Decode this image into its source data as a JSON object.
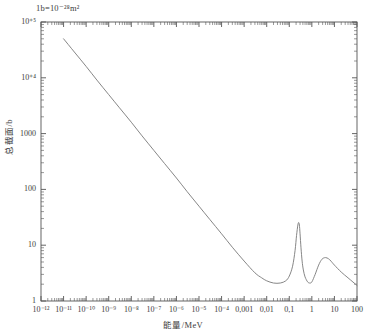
{
  "annotation": {
    "unit_note": "1b=10⁻²⁸m²"
  },
  "axes": {
    "x_title": "能量/MeV",
    "y_title": "总截面/b"
  },
  "chart_data": {
    "type": "line",
    "title": "",
    "subtitle": "",
    "xlabel": "能量/MeV",
    "ylabel": "总截面/b",
    "xscale": "log",
    "yscale": "log",
    "xlim": [
      1e-12,
      100
    ],
    "ylim": [
      1,
      100000
    ],
    "grid": false,
    "legend": null,
    "annotations": [
      "1b=10⁻²⁸m²"
    ],
    "x_tick_labels": [
      "10⁻¹²",
      "10⁻¹¹",
      "10⁻¹⁰",
      "10⁻⁹",
      "10⁻⁸",
      "10⁻⁷",
      "10⁻⁶",
      "10⁻⁵",
      "10⁻⁴",
      "0,001",
      "0,01",
      "0,1",
      "1",
      "10",
      "100"
    ],
    "x_tick_values": [
      1e-12,
      1e-11,
      1e-10,
      1e-09,
      1e-08,
      1e-07,
      1e-06,
      1e-05,
      0.0001,
      0.001,
      0.01,
      0.1,
      1,
      10,
      100
    ],
    "y_tick_labels": [
      "1",
      "10",
      "100",
      "1000",
      "10⁺⁴",
      "10⁺⁵"
    ],
    "y_tick_values": [
      1,
      10,
      100,
      1000,
      10000,
      100000
    ],
    "minor_ticks": true,
    "series": [
      {
        "name": "total cross section",
        "color": "#808080",
        "x": [
          1e-11,
          3e-11,
          1e-10,
          3e-10,
          1e-09,
          3e-09,
          1e-08,
          3e-08,
          1e-07,
          3e-07,
          1e-06,
          3e-06,
          1e-05,
          3e-05,
          0.0001,
          0.0003,
          0.001,
          0.003,
          0.006,
          0.01,
          0.02,
          0.04,
          0.07,
          0.1,
          0.14,
          0.18,
          0.21,
          0.24,
          0.26,
          0.28,
          0.3,
          0.33,
          0.37,
          0.42,
          0.5,
          0.65,
          0.8,
          1.0,
          1.4,
          2.0,
          2.8,
          4.0,
          5.5,
          7.0,
          10.0,
          20.0,
          40.0,
          100.0
        ],
        "y": [
          50000.0,
          29000.0,
          16000.0,
          9100.0,
          5000.0,
          2900.0,
          1600.0,
          910.0,
          500.0,
          290.0,
          160.0,
          91.0,
          50.0,
          29.0,
          16.0,
          9.2,
          5.2,
          3.2,
          2.6,
          2.3,
          2.1,
          2.1,
          2.3,
          2.8,
          4.2,
          8.0,
          15.0,
          23.0,
          25.5,
          23.0,
          16.0,
          9.0,
          5.2,
          3.6,
          2.7,
          2.2,
          2.1,
          2.2,
          3.0,
          4.4,
          5.6,
          6.0,
          5.7,
          5.2,
          4.4,
          3.3,
          2.6,
          1.9
        ],
        "features": [
          {
            "kind": "1/v-slope",
            "range": [
              1e-11,
              0.001
            ],
            "note": "straight line on log-log, slope -1/2"
          },
          {
            "kind": "resonance-peak",
            "position": 0.26,
            "height": 25.5
          },
          {
            "kind": "resonance-peak",
            "position": 4.0,
            "height": 6.0
          }
        ]
      }
    ]
  }
}
